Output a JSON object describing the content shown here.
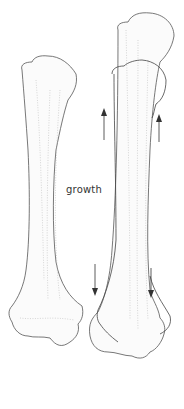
{
  "diagram": {
    "label": "growth",
    "elements": [
      {
        "name": "young-bone",
        "description": "smaller long bone (before growth)"
      },
      {
        "name": "grown-bone",
        "description": "larger long bone with outline of smaller bone overlaid"
      },
      {
        "name": "upward-arrows",
        "count": 2
      },
      {
        "name": "downward-arrows",
        "count": 2
      }
    ],
    "colors": {
      "line": "#555555",
      "background": "#ffffff",
      "arrow": "#333333"
    }
  }
}
